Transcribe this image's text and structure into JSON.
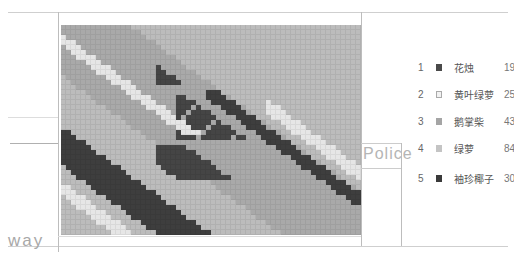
{
  "labels": {
    "left_bottom": "way",
    "right_box": "Police"
  },
  "palette": {
    "1": "#454545",
    "2": "#e6e6e6",
    "3": "#a9a9a9",
    "4": "#bcbcbc",
    "5": "#3e3e3e"
  },
  "legend": [
    {
      "index": "1",
      "name": "花烛",
      "value": "198",
      "color": "#4a4a4a",
      "outline": false
    },
    {
      "index": "2",
      "name": "黄叶绿萝",
      "value": "254",
      "color": "#f2f2f2",
      "outline": true
    },
    {
      "index": "3",
      "name": "鹅掌柴",
      "value": "430",
      "color": "#a5a5a5",
      "outline": false
    },
    {
      "index": "4",
      "name": "绿萝",
      "value": "849",
      "color": "#c4c4c4",
      "outline": false
    },
    {
      "index": "5",
      "name": "袖珍椰子",
      "value": "300",
      "color": "#3a3a3a",
      "outline": false
    }
  ],
  "grid": {
    "cols": 60,
    "rows": 42,
    "cell_px": 5
  }
}
